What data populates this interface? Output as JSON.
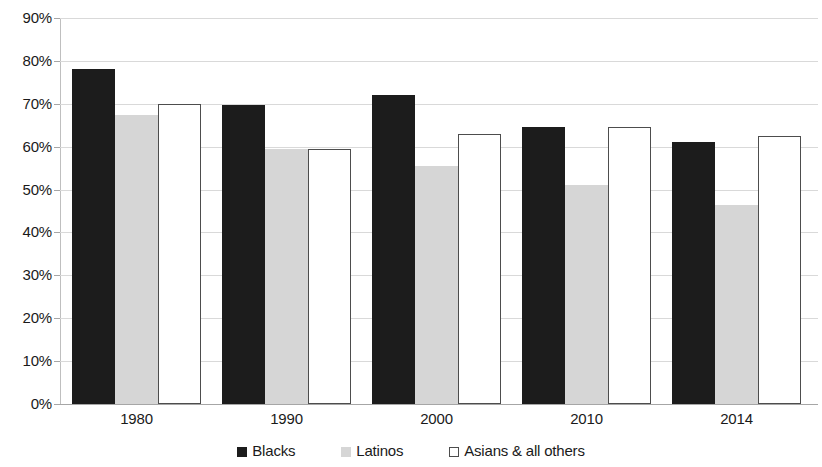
{
  "chart_data": {
    "type": "bar",
    "title": "",
    "subtitle": "",
    "xlabel": "",
    "ylabel": "",
    "categories": [
      "1980",
      "1990",
      "2000",
      "2010",
      "2014"
    ],
    "series": [
      {
        "name": "Blacks",
        "color": "#1c1c1c",
        "values": [
          78.0,
          69.8,
          72.0,
          64.7,
          61.0
        ]
      },
      {
        "name": "Latinos",
        "color": "#d6d6d6",
        "values": [
          67.5,
          59.5,
          55.5,
          51.0,
          46.5
        ]
      },
      {
        "name": "Asians & all others",
        "color": "#ffffff",
        "values": [
          70.0,
          59.5,
          63.0,
          64.7,
          62.5
        ]
      }
    ],
    "ylim": [
      0,
      90
    ],
    "ytick_step": 10,
    "ytick_labels": [
      "90%",
      "80%",
      "70%",
      "60%",
      "50%",
      "40%",
      "30%",
      "20%",
      "10%",
      "0%"
    ],
    "ytick_values": [
      90,
      80,
      70,
      60,
      50,
      40,
      30,
      20,
      10,
      0
    ],
    "grid": true,
    "grid_axis": "y",
    "legend_position": "bottom",
    "value_suffix": "%"
  }
}
